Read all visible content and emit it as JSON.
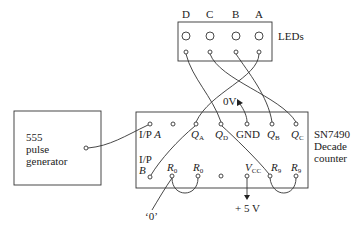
{
  "diagram": {
    "type": "circuit-wiring",
    "led_panel": {
      "label": "LEDs",
      "leds": [
        {
          "name": "D",
          "x": 186
        },
        {
          "name": "C",
          "x": 210
        },
        {
          "name": "B",
          "x": 236
        },
        {
          "name": "A",
          "x": 259
        }
      ]
    },
    "pulse_generator": {
      "lines": [
        "555",
        "pulse",
        "generator"
      ]
    },
    "counter": {
      "lines": [
        "SN7490",
        "Decade",
        "counter"
      ],
      "top_pins": [
        {
          "label": "I/P",
          "sub": "A"
        },
        {
          "label": "",
          "sub": ""
        },
        {
          "label": "Q",
          "sub": "A"
        },
        {
          "label": "Q",
          "sub": "D"
        },
        {
          "label": "GND",
          "sub": ""
        },
        {
          "label": "Q",
          "sub": "B"
        },
        {
          "label": "Q",
          "sub": "C"
        }
      ],
      "bottom_pins": [
        {
          "label": "I/P B",
          "sub": ""
        },
        {
          "label": "R",
          "sub": "0"
        },
        {
          "label": "R",
          "sub": "0"
        },
        {
          "label": "",
          "sub": ""
        },
        {
          "label": "V",
          "sub": "CC"
        },
        {
          "label": "R",
          "sub": "9"
        },
        {
          "label": "R",
          "sub": "9"
        }
      ]
    },
    "annotations": {
      "zero_volt": "0V",
      "plus_five": "+ 5 V",
      "zero_input": "‘0’"
    },
    "connections": [
      [
        "LED D",
        "QD"
      ],
      [
        "LED C",
        "QC"
      ],
      [
        "LED B",
        "QB"
      ],
      [
        "LED A",
        "QA"
      ],
      [
        "555 output",
        "I/P A"
      ],
      [
        "I/P B",
        "QA"
      ],
      [
        "QD",
        "R9"
      ],
      [
        "R0",
        "R0"
      ],
      [
        "R9",
        "R9"
      ],
      [
        "0V",
        "GND"
      ],
      [
        "VCC",
        "+5 V"
      ],
      [
        "R0",
        "'0'"
      ]
    ]
  },
  "text": {
    "led_D": "D",
    "led_C": "C",
    "led_B": "B",
    "led_A": "A",
    "leds_label": "LEDs",
    "gen_1": "555",
    "gen_2": "pulse",
    "gen_3": "generator",
    "ctr_1": "SN7490",
    "ctr_2": "Decade",
    "ctr_3": "counter",
    "ipa": "I/P",
    "ipa_sub": "A",
    "ipb_1": "I/P",
    "ipb_2": "B",
    "q": "Q",
    "qa_sub": "A",
    "qd_sub": "D",
    "qb_sub": "B",
    "qc_sub": "C",
    "gnd": "GND",
    "r": "R",
    "r0_sub": "0",
    "r9_sub": "9",
    "v": "V",
    "vcc_sub": "CC",
    "zero_volt": "0V",
    "plus_five": "+ 5 V",
    "zero_input": "‘0’"
  }
}
